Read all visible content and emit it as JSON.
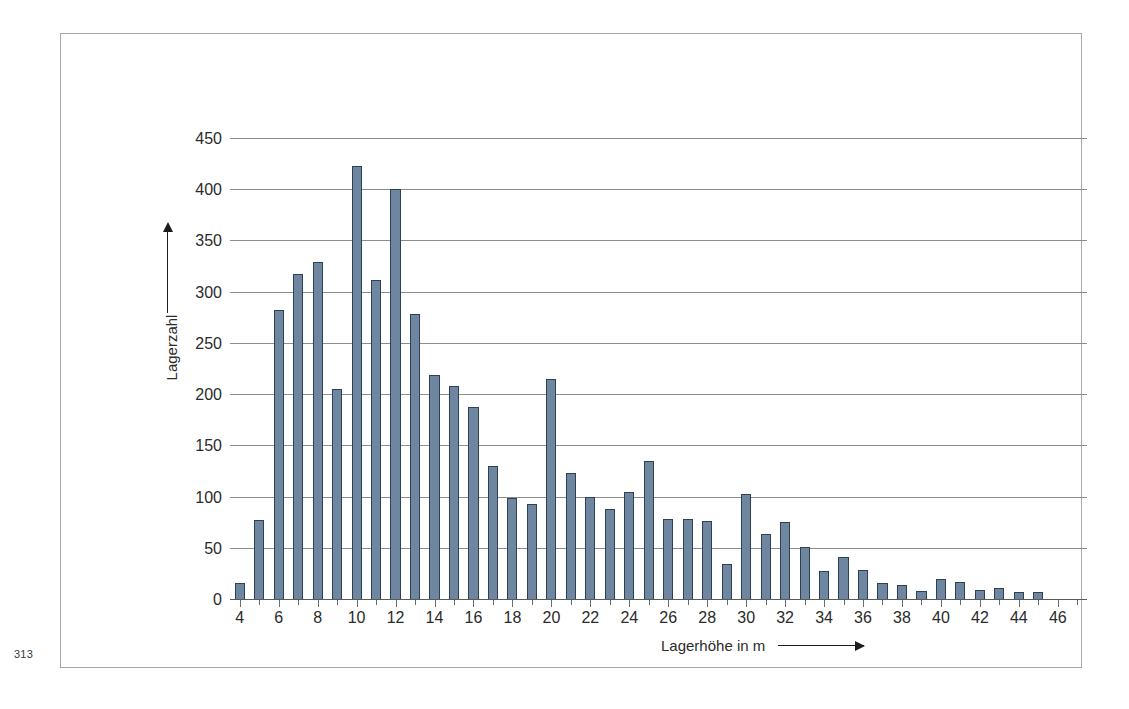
{
  "page": {
    "number": "313"
  },
  "chart_data": {
    "type": "bar",
    "title": "",
    "xlabel": "Lagerhöhe in m",
    "ylabel": "Lagerzahl",
    "xlim": [
      3.5,
      47.5
    ],
    "ylim": [
      0,
      450
    ],
    "grid": true,
    "legend": null,
    "bar_color": "#6e86a0",
    "bar_edge_color": "#2e4257",
    "grid_color": "#8d8d8d",
    "y_ticks": [
      0,
      50,
      100,
      150,
      200,
      250,
      300,
      350,
      400,
      450
    ],
    "y_tick_labels": [
      "0",
      "50",
      "100",
      "150",
      "200",
      "250",
      "300",
      "350",
      "400",
      "450"
    ],
    "x_major_ticks": [
      4,
      6,
      8,
      10,
      12,
      14,
      16,
      18,
      20,
      22,
      24,
      26,
      28,
      30,
      32,
      34,
      36,
      38,
      40,
      42,
      44,
      46
    ],
    "x_tick_labels": [
      "4",
      "6",
      "8",
      "10",
      "12",
      "14",
      "16",
      "18",
      "20",
      "22",
      "24",
      "26",
      "28",
      "30",
      "32",
      "34",
      "36",
      "38",
      "40",
      "42",
      "44",
      "46"
    ],
    "x_minor_step": 1,
    "categories": [
      4,
      5,
      6,
      7,
      8,
      9,
      10,
      11,
      12,
      13,
      14,
      15,
      16,
      17,
      18,
      19,
      20,
      21,
      22,
      23,
      24,
      25,
      26,
      27,
      28,
      29,
      30,
      31,
      32,
      33,
      34,
      35,
      36,
      37,
      38,
      39,
      40,
      41,
      42,
      43,
      44,
      45
    ],
    "values": [
      17,
      78,
      283,
      318,
      330,
      206,
      424,
      312,
      401,
      279,
      220,
      209,
      188,
      131,
      100,
      94,
      216,
      124,
      101,
      89,
      105,
      136,
      79,
      79,
      77,
      35,
      103,
      64,
      76,
      52,
      28,
      42,
      29,
      17,
      15,
      9,
      21,
      18,
      10,
      12,
      8,
      8
    ],
    "annotations": {
      "y_axis_arrow": "up-arrow",
      "x_axis_arrow": "right-arrow"
    }
  }
}
